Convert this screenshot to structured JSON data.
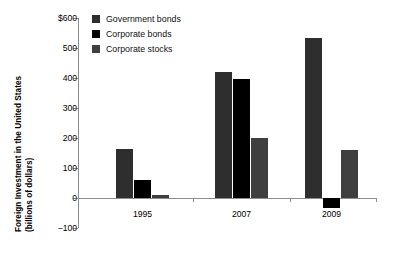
{
  "chart_data": {
    "type": "bar",
    "title": "",
    "subtitle": "",
    "xlabel": "",
    "ylabel_line1": "Foreign Investment in the United States",
    "ylabel_line2": "(billions of dollars)",
    "categories": [
      "1995",
      "2007",
      "2009"
    ],
    "series": [
      {
        "name": "Government bonds",
        "color": "#2e2e2e",
        "values": [
          165,
          420,
          532
        ]
      },
      {
        "name": "Corporate bonds",
        "color": "#000000",
        "values": [
          60,
          397,
          -32
        ]
      },
      {
        "name": "Corporate stocks",
        "color": "#3f3f3f",
        "values": [
          10,
          200,
          159
        ]
      }
    ],
    "ylim": [
      -100,
      600
    ],
    "yticks": [
      600,
      500,
      400,
      300,
      200,
      100,
      0,
      -100
    ],
    "ytick_labels": [
      "$600",
      "500",
      "400",
      "300",
      "200",
      "100",
      "0",
      "−100"
    ],
    "grid": false,
    "legend_position": "top-left-inside"
  }
}
